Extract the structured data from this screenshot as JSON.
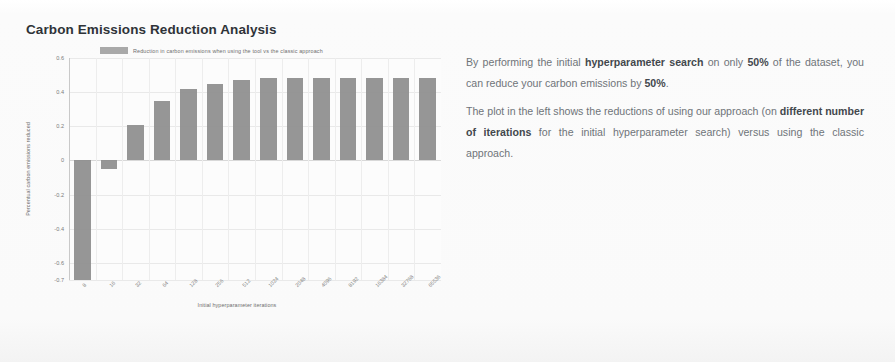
{
  "title": "Carbon Emissions Reduction Analysis",
  "chart_data": {
    "type": "bar",
    "title": "Carbon Emissions Reduction Analysis",
    "xlabel": "Initial hyperparameter iterations",
    "ylabel": "Percentual carbon emissions reduced",
    "legend": {
      "position": "top",
      "entries": [
        "Reduction in carbon emissions when using the tool vs the classic approach"
      ]
    },
    "grid": true,
    "ylim": [
      -0.7,
      0.6
    ],
    "yticks": [
      "0.6",
      "0.4",
      "0.2",
      "0",
      "-0.2",
      "-0.4",
      "-0.6",
      "-0.7"
    ],
    "ytick_values": [
      0.6,
      0.4,
      0.2,
      0,
      -0.2,
      -0.4,
      -0.6,
      -0.7
    ],
    "categories": [
      "8",
      "16",
      "32",
      "64",
      "128",
      "256",
      "512",
      "1024",
      "2048",
      "4096",
      "8192",
      "16384",
      "32768",
      "65536"
    ],
    "values": [
      -0.7,
      -0.05,
      0.21,
      0.35,
      0.42,
      0.45,
      0.47,
      0.48,
      0.48,
      0.48,
      0.48,
      0.48,
      0.48,
      0.48
    ],
    "bar_color": "#8d8d8d"
  },
  "legend": {
    "swatch_color": "#9a9a9a",
    "label": "Reduction in carbon emissions when using the tool vs the classic approach"
  },
  "description": {
    "paragraph1": {
      "part1": "By performing the initial ",
      "bold1": "hyperparameter search",
      "part2": " on only ",
      "bold2": "50%",
      "part3": " of the dataset, you can reduce your carbon emissions by ",
      "bold3": "50%",
      "part4": "."
    },
    "paragraph2": {
      "part1": "The plot in the left shows the reductions of using our approach (on ",
      "bold1": "different number of iterations",
      "part2": " for the initial hyperparameter search) versus using the classic approach."
    }
  }
}
